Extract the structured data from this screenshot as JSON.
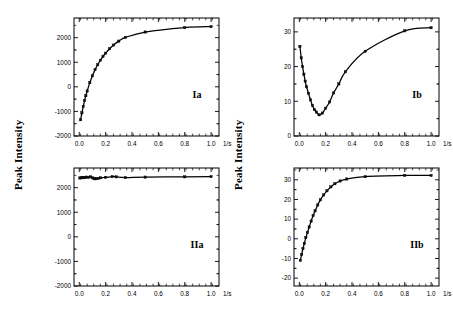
{
  "figure": {
    "ylabel_left": "Peak Intensity",
    "ylabel_right": "Peak Intensity",
    "xunit": "1/s"
  },
  "chart_data": [
    {
      "type": "scatter",
      "panel_id": "Ia",
      "title": "",
      "xlabel": "1/s",
      "ylabel": "Peak Intensity",
      "xlim": [
        -0.04,
        1.06
      ],
      "ylim": [
        -2000,
        2800
      ],
      "xticks": [
        0.0,
        0.2,
        0.4,
        0.6,
        0.8,
        1.0
      ],
      "xticklabels": [
        "0.0",
        "0.2",
        "0.4",
        "0.6",
        "0.8",
        "1.0"
      ],
      "yticks": [
        -2000,
        -1000,
        0,
        1000,
        2000
      ],
      "yticklabels": [
        "-2000",
        "-1000",
        "0",
        "1000",
        "2000"
      ],
      "grid": false,
      "legend": "none",
      "x": [
        0.01,
        0.02,
        0.03,
        0.04,
        0.05,
        0.06,
        0.08,
        0.1,
        0.12,
        0.14,
        0.16,
        0.18,
        0.2,
        0.23,
        0.26,
        0.3,
        0.35,
        0.5,
        0.8,
        1.0
      ],
      "values": [
        -1340,
        -1060,
        -800,
        -560,
        -360,
        -170,
        170,
        450,
        700,
        900,
        1080,
        1240,
        1370,
        1550,
        1700,
        1860,
        2010,
        2230,
        2410,
        2450
      ],
      "fit_curve": {
        "model": "exponential-saturation",
        "description": "monotonic rise from -1340 saturating near 2460"
      }
    },
    {
      "type": "scatter",
      "panel_id": "Ib",
      "title": "",
      "xlabel": "1/s",
      "ylabel": "Peak Intensity",
      "xlim": [
        -0.04,
        1.06
      ],
      "ylim": [
        0,
        34
      ],
      "xticks": [
        0.0,
        0.2,
        0.4,
        0.6,
        0.8,
        1.0
      ],
      "xticklabels": [
        "0.0",
        "0.2",
        "0.4",
        "0.6",
        "0.8",
        "1.0"
      ],
      "yticks": [
        0,
        10,
        20,
        30
      ],
      "yticklabels": [
        "0",
        "10",
        "20",
        "30"
      ],
      "grid": false,
      "legend": "none",
      "x": [
        0.005,
        0.015,
        0.025,
        0.035,
        0.045,
        0.055,
        0.07,
        0.085,
        0.1,
        0.115,
        0.13,
        0.15,
        0.175,
        0.2,
        0.23,
        0.26,
        0.3,
        0.35,
        0.5,
        0.8,
        1.0
      ],
      "values": [
        25.8,
        22.5,
        20.0,
        17.8,
        15.8,
        14.2,
        12.3,
        10.4,
        8.8,
        7.6,
        6.9,
        6.1,
        6.6,
        8.0,
        9.8,
        12.4,
        15.0,
        18.5,
        24.4,
        30.3,
        31.2
      ],
      "fit_curve": {
        "model": "dip-then-rise",
        "description": "falls from 26 to minimum 6.0 near x=0.14 then rises to plateau 31.2"
      }
    },
    {
      "type": "scatter",
      "panel_id": "IIa",
      "title": "",
      "xlabel": "1/s",
      "ylabel": "Peak Intensity",
      "xlim": [
        -0.04,
        1.06
      ],
      "ylim": [
        -2000,
        2800
      ],
      "xticks": [
        0.0,
        0.2,
        0.4,
        0.6,
        0.8,
        1.0
      ],
      "xticklabels": [
        "0.0",
        "0.2",
        "0.4",
        "0.6",
        "0.8",
        "1.0"
      ],
      "yticks": [
        -2000,
        -1000,
        0,
        1000,
        2000
      ],
      "yticklabels": [
        "-2000",
        "-1000",
        "0",
        "1000",
        "2000"
      ],
      "grid": false,
      "legend": "none",
      "x": [
        0.005,
        0.015,
        0.025,
        0.035,
        0.045,
        0.055,
        0.07,
        0.085,
        0.1,
        0.11,
        0.12,
        0.13,
        0.145,
        0.16,
        0.2,
        0.25,
        0.28,
        0.35,
        0.5,
        0.8,
        1.0
      ],
      "values": [
        2395,
        2400,
        2415,
        2405,
        2420,
        2430,
        2420,
        2440,
        2405,
        2370,
        2360,
        2365,
        2380,
        2400,
        2420,
        2450,
        2440,
        2410,
        2430,
        2440,
        2450
      ],
      "fit_curve": {
        "model": "flat-line",
        "description": "essentially constant near 2430 across full range"
      }
    },
    {
      "type": "scatter",
      "panel_id": "IIb",
      "title": "",
      "xlabel": "1/s",
      "ylabel": "Peak Intensity",
      "xlim": [
        -0.04,
        1.06
      ],
      "ylim": [
        -24,
        36
      ],
      "xticks": [
        0.0,
        0.2,
        0.4,
        0.6,
        0.8,
        1.0
      ],
      "xticklabels": [
        "0.0",
        "0.2",
        "0.4",
        "0.6",
        "0.8",
        "1.0"
      ],
      "yticks": [
        -20,
        -10,
        0,
        10,
        20,
        30
      ],
      "yticklabels": [
        "-20",
        "-10",
        "0",
        "10",
        "20",
        "30"
      ],
      "grid": false,
      "legend": "none",
      "x": [
        0.008,
        0.018,
        0.028,
        0.038,
        0.05,
        0.062,
        0.075,
        0.09,
        0.105,
        0.12,
        0.14,
        0.16,
        0.185,
        0.21,
        0.24,
        0.27,
        0.31,
        0.36,
        0.5,
        0.8,
        1.0
      ],
      "values": [
        -11.0,
        -8.0,
        -5.0,
        -2.4,
        0.6,
        3.2,
        6.0,
        9.0,
        11.8,
        14.2,
        17.2,
        19.8,
        22.3,
        24.4,
        26.4,
        28.0,
        29.4,
        30.4,
        31.6,
        32.2,
        32.2
      ],
      "fit_curve": {
        "model": "exponential-saturation",
        "description": "rises from -11 saturating near 32.2"
      }
    }
  ]
}
